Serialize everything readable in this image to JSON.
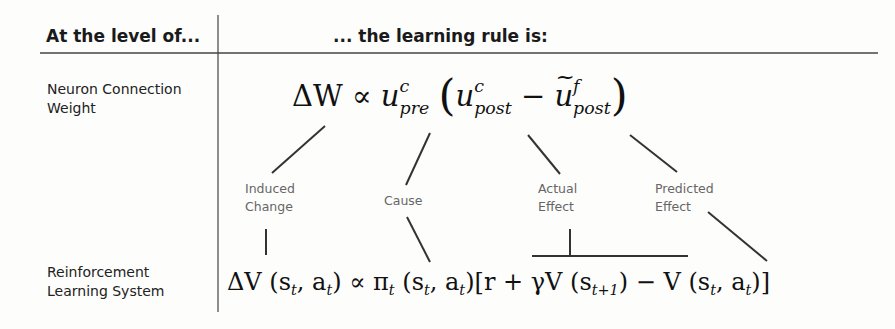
{
  "header": {
    "left": "At the level of...",
    "right": "... the learning rule is:"
  },
  "rows": [
    {
      "label_line1": "Neuron Connection",
      "label_line2": "Weight",
      "equation": {
        "delta": "ΔW",
        "prop": "∝",
        "u": "u",
        "pre_sup": "c",
        "pre_sub": "pre",
        "lparen": "(",
        "post_sup": "c",
        "post_sub": "post",
        "minus": "−",
        "pred_sup": "f",
        "pred_sub": "post",
        "rparen": ")"
      },
      "text": "ΔW ∝ u^c_pre (u^c_post − ũ^f_post)"
    },
    {
      "label_line1": "Reinforcement",
      "label_line2": "Learning System",
      "equation": {
        "delta": "ΔV",
        "args1": "(s",
        "t": "t",
        "comma_a": ", a",
        "close": ")",
        "prop": "∝",
        "pi": "π",
        "lbracket": "[r + γV",
        "t1": "t+1",
        "minus": ") − V",
        "rbracket": ")]"
      },
      "text": "ΔV(s_t, a_t) ∝ π_t(s_t, a_t)[r + γV(s_{t+1}) − V(s_t, a_t)]"
    }
  ],
  "annotations": [
    {
      "line1": "Induced",
      "line2": "Change"
    },
    {
      "line1": "Cause",
      "line2": ""
    },
    {
      "line1": "Actual",
      "line2": "Effect"
    },
    {
      "line1": "Predicted",
      "line2": "Effect"
    }
  ],
  "colors": {
    "text": "#1a1a1a",
    "annotation": "#666666",
    "lines": "#333333"
  }
}
